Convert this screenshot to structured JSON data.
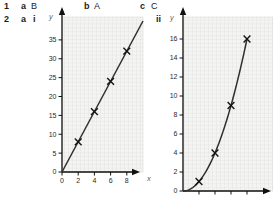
{
  "answers": {
    "q1": {
      "number": "1",
      "parts": [
        {
          "label": "a",
          "value": "B"
        },
        {
          "label": "b",
          "value": "A"
        },
        {
          "label": "c",
          "value": "C"
        }
      ]
    },
    "q2": {
      "number": "2",
      "part_label": "a",
      "sub_i_label": "i",
      "sub_ii_label": "ii"
    }
  },
  "chart_data": [
    {
      "id": "graph-i",
      "type": "line",
      "equation": "y = 4x",
      "x": [
        2,
        4,
        6,
        8
      ],
      "y": [
        8,
        16,
        24,
        32
      ],
      "marker": "x",
      "line_through_origin": true,
      "xlabel": "x",
      "ylabel": "y",
      "x_ticks": [
        0,
        2,
        4,
        6,
        8
      ],
      "x_tick_labels_visible": true,
      "y_ticks": [
        0,
        5,
        10,
        15,
        20,
        25,
        30,
        35
      ],
      "xlim": [
        0,
        10
      ],
      "ylim": [
        0,
        41
      ],
      "grid": true,
      "legend": false
    },
    {
      "id": "graph-ii",
      "type": "line",
      "equation": "y = x^2",
      "x": [
        1,
        2,
        3,
        4
      ],
      "y": [
        1,
        4,
        9,
        16
      ],
      "marker": "x",
      "curve": true,
      "xlabel": "",
      "ylabel": "y",
      "x_ticks": [
        1,
        2,
        3,
        4
      ],
      "x_tick_labels_visible": false,
      "y_ticks": [
        0,
        2,
        4,
        6,
        8,
        10,
        12,
        14,
        16
      ],
      "xlim": [
        0,
        5.5
      ],
      "ylim": [
        0,
        18.3
      ],
      "grid": true,
      "legend": false
    }
  ],
  "colors": {
    "grid_bg": "#f4f4f3",
    "grid_line": "#d7d7d7",
    "axis": "#111111",
    "series_line": "#2f2f2f",
    "marker": "#141414",
    "tick_text": "#2a2a2a",
    "axis_letter": "#5c5c5c",
    "answer_text": "#1c1c1c"
  }
}
